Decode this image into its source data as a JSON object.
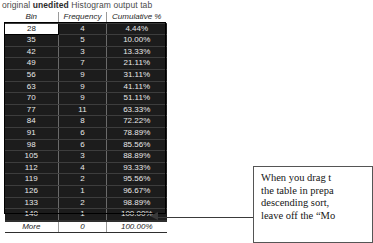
{
  "caption": {
    "prefix": "original ",
    "emphasis": "unedited",
    "suffix": " Histogram output tab"
  },
  "table": {
    "columns": [
      "Bin",
      "Frequency",
      "Cumulative %"
    ],
    "rows": [
      {
        "bin": "28",
        "frequency": "4",
        "cumulative": "4.44%",
        "selected": true
      },
      {
        "bin": "35",
        "frequency": "5",
        "cumulative": "10.00%",
        "selected": false
      },
      {
        "bin": "42",
        "frequency": "3",
        "cumulative": "13.33%",
        "selected": false
      },
      {
        "bin": "49",
        "frequency": "7",
        "cumulative": "21.11%",
        "selected": false
      },
      {
        "bin": "56",
        "frequency": "9",
        "cumulative": "31.11%",
        "selected": false
      },
      {
        "bin": "63",
        "frequency": "9",
        "cumulative": "41.11%",
        "selected": false
      },
      {
        "bin": "70",
        "frequency": "9",
        "cumulative": "51.11%",
        "selected": false
      },
      {
        "bin": "77",
        "frequency": "11",
        "cumulative": "63.33%",
        "selected": false
      },
      {
        "bin": "84",
        "frequency": "8",
        "cumulative": "72.22%",
        "selected": false
      },
      {
        "bin": "91",
        "frequency": "6",
        "cumulative": "78.89%",
        "selected": false
      },
      {
        "bin": "98",
        "frequency": "6",
        "cumulative": "85.56%",
        "selected": false
      },
      {
        "bin": "105",
        "frequency": "3",
        "cumulative": "88.89%",
        "selected": false
      },
      {
        "bin": "112",
        "frequency": "4",
        "cumulative": "93.33%",
        "selected": false
      },
      {
        "bin": "119",
        "frequency": "2",
        "cumulative": "95.56%",
        "selected": false
      },
      {
        "bin": "126",
        "frequency": "1",
        "cumulative": "96.67%",
        "selected": false
      },
      {
        "bin": "133",
        "frequency": "2",
        "cumulative": "98.89%",
        "selected": false
      },
      {
        "bin": "140",
        "frequency": "1",
        "cumulative": "100.00%",
        "selected": false
      }
    ],
    "footer": {
      "bin": "More",
      "frequency": "0",
      "cumulative": "100.00%"
    }
  },
  "callout": {
    "lines": [
      "When you drag t",
      "the table in prepa",
      "descending sort,",
      "leave off the “Mo"
    ]
  },
  "chart_data": {
    "type": "table",
    "title": "Histogram output tab",
    "columns": [
      "Bin",
      "Frequency",
      "Cumulative %"
    ],
    "bins": [
      28,
      35,
      42,
      49,
      56,
      63,
      70,
      77,
      84,
      91,
      98,
      105,
      112,
      119,
      126,
      133,
      140
    ],
    "frequencies": [
      4,
      5,
      3,
      7,
      9,
      9,
      9,
      11,
      8,
      6,
      6,
      3,
      4,
      2,
      1,
      2,
      1
    ],
    "cumulative_percent": [
      4.44,
      10.0,
      13.33,
      21.11,
      31.11,
      41.11,
      51.11,
      63.33,
      72.22,
      78.89,
      85.56,
      88.89,
      93.33,
      95.56,
      96.67,
      98.89,
      100.0
    ],
    "more_row": {
      "bin": "More",
      "frequency": 0,
      "cumulative_percent": 100.0
    },
    "total_frequency": 90
  },
  "colors": {
    "table_fill": "#1c1c1c",
    "table_text": "#e8e8e8",
    "selected_cell": "#ffffff",
    "leader_line": "#3a3a3a",
    "callout_border": "#555555"
  }
}
